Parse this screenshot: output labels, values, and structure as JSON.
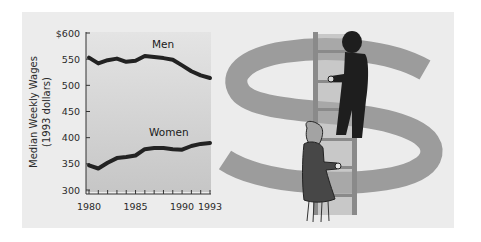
{
  "chart_data": {
    "type": "line",
    "title": "",
    "xlabel": "",
    "ylabel": "Median Weekly Wages (1993 dollars)",
    "ylabel_lines": [
      "Median Weekly Wages",
      "(1993 dollars)"
    ],
    "ylim": [
      300,
      600
    ],
    "xlim": [
      1980,
      1993
    ],
    "y_ticks": [
      "$600",
      "550",
      "500",
      "450",
      "400",
      "350",
      "300"
    ],
    "x_ticks": [
      "1980",
      "1985",
      "1990",
      "1993"
    ],
    "x": [
      1980,
      1981,
      1982,
      1983,
      1984,
      1985,
      1986,
      1987,
      1988,
      1989,
      1990,
      1991,
      1992,
      1993
    ],
    "series": [
      {
        "name": "Men",
        "values": [
          553,
          542,
          548,
          551,
          545,
          547,
          556,
          554,
          552,
          549,
          538,
          527,
          519,
          514
        ]
      },
      {
        "name": "Women",
        "values": [
          347,
          341,
          352,
          361,
          363,
          366,
          378,
          380,
          380,
          378,
          377,
          384,
          388,
          390
        ]
      }
    ],
    "grid": false,
    "legend": "inline labels",
    "colors": {
      "line": "#222222",
      "plot_top": "#e4e4e4",
      "plot_bottom": "#c6c6c6"
    }
  },
  "illustration": {
    "description": "Man and woman climbing a ladder in front of a large dollar sign",
    "colors": {
      "dollar": "#9c9c9c",
      "ladder": "#8a8a8a",
      "man": "#1e1e1e",
      "woman_dress": "#474747",
      "woman_hair": "#a3a3a3"
    }
  }
}
